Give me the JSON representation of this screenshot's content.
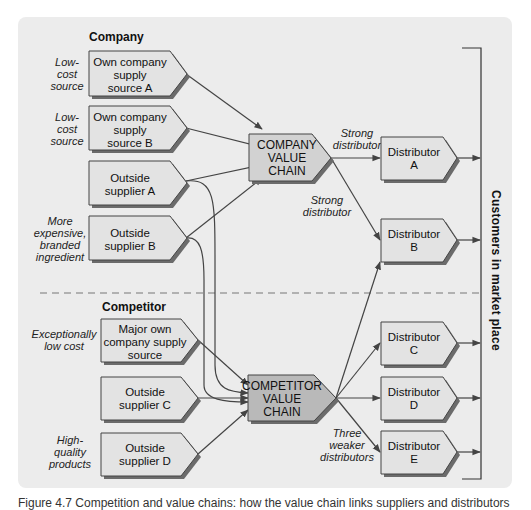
{
  "sections": {
    "company": "Company",
    "competitor": "Competitor"
  },
  "company_sources": [
    {
      "label_lines": [
        "Own company",
        "supply",
        "source A"
      ],
      "note_lines": [
        "Low-",
        "cost",
        "source"
      ]
    },
    {
      "label_lines": [
        "Own company",
        "supply",
        "source B"
      ],
      "note_lines": [
        "Low-",
        "cost",
        "source"
      ]
    },
    {
      "label_lines": [
        "Outside",
        "supplier A"
      ],
      "note_lines": []
    },
    {
      "label_lines": [
        "Outside",
        "supplier B"
      ],
      "note_lines": [
        "More",
        "expensive,",
        "branded",
        "ingredient"
      ]
    }
  ],
  "competitor_sources": [
    {
      "label_lines": [
        "Major own",
        "company supply",
        "source"
      ],
      "note_lines": [
        "Exceptionally",
        "low cost"
      ]
    },
    {
      "label_lines": [
        "Outside",
        "supplier C"
      ],
      "note_lines": []
    },
    {
      "label_lines": [
        "Outside",
        "supplier D"
      ],
      "note_lines": [
        "High-",
        "quality",
        "products"
      ]
    }
  ],
  "value_chains": {
    "company": [
      "COMPANY",
      "VALUE",
      "CHAIN"
    ],
    "competitor": [
      "COMPETITOR",
      "VALUE",
      "CHAIN"
    ]
  },
  "distributors": [
    {
      "lines": [
        "Distributor",
        "A"
      ]
    },
    {
      "lines": [
        "Distributor",
        "B"
      ]
    },
    {
      "lines": [
        "Distributor",
        "C"
      ]
    },
    {
      "lines": [
        "Distributor",
        "D"
      ]
    },
    {
      "lines": [
        "Distributor",
        "E"
      ]
    }
  ],
  "edge_labels": {
    "strong_a": [
      "Strong",
      "distributor"
    ],
    "strong_b": [
      "Strong",
      "distributor"
    ],
    "weaker": [
      "Three",
      "weaker",
      "distributors"
    ]
  },
  "market_label": "Customers  in  market  place",
  "caption": "Figure 4.7  Competition and value chains: how the value chain links suppliers and distributors"
}
